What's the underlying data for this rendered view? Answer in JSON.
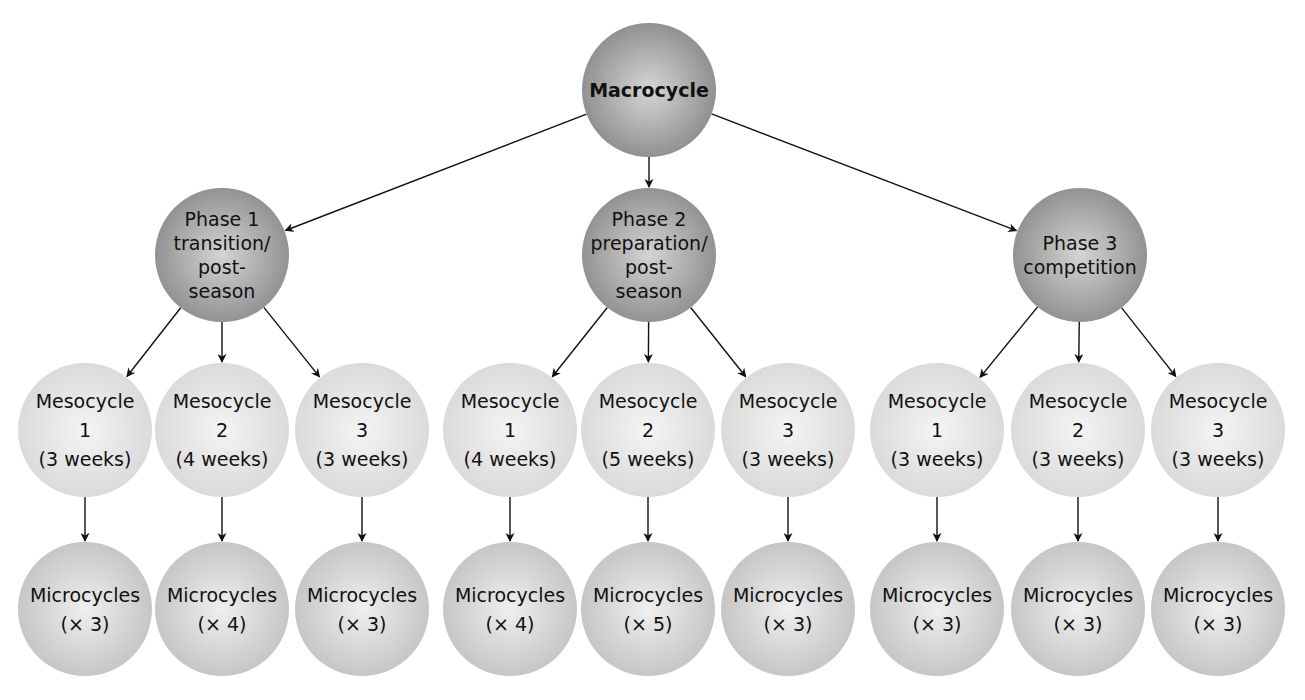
{
  "diagram": {
    "type": "hierarchy",
    "colors": {
      "macro_fill_center": "#d6d6d6",
      "macro_fill_edge": "#8a8a8a",
      "phase_fill_center": "#d4d4d4",
      "phase_fill_edge": "#8c8c8c",
      "meso_fill_center": "#f4f4f4",
      "meso_fill_edge": "#d8d8d8",
      "micro_fill_center": "#efefef",
      "micro_fill_edge": "#c2c2c2",
      "edge": "#111111"
    },
    "macrocycle": {
      "label": "Macrocycle",
      "cx": 649,
      "cy": 90,
      "r": 67
    },
    "phases": [
      {
        "lines": [
          "Phase 1",
          "transition/",
          "post-",
          "season"
        ],
        "cx": 222,
        "cy": 255,
        "r": 67,
        "mesocycles": [
          {
            "lines": [
              "Mesocycle",
              "1",
              "(3 weeks)"
            ],
            "cx": 85,
            "weeks": 3,
            "micro": {
              "lines": [
                "Microcycles",
                "(× 3)"
              ],
              "count": 3
            }
          },
          {
            "lines": [
              "Mesocycle",
              "2",
              "(4 weeks)"
            ],
            "cx": 222,
            "weeks": 4,
            "micro": {
              "lines": [
                "Microcycles",
                "(× 4)"
              ],
              "count": 4
            }
          },
          {
            "lines": [
              "Mesocycle",
              "3",
              "(3 weeks)"
            ],
            "cx": 362,
            "weeks": 3,
            "micro": {
              "lines": [
                "Microcycles",
                "(× 3)"
              ],
              "count": 3
            }
          }
        ]
      },
      {
        "lines": [
          "Phase 2",
          "preparation/",
          "post-",
          "season"
        ],
        "cx": 649,
        "cy": 255,
        "r": 67,
        "mesocycles": [
          {
            "lines": [
              "Mesocycle",
              "1",
              "(4 weeks)"
            ],
            "cx": 510,
            "weeks": 4,
            "micro": {
              "lines": [
                "Microcycles",
                "(× 4)"
              ],
              "count": 4
            }
          },
          {
            "lines": [
              "Mesocycle",
              "2",
              "(5 weeks)"
            ],
            "cx": 648,
            "weeks": 5,
            "micro": {
              "lines": [
                "Microcycles",
                "(× 5)"
              ],
              "count": 5
            }
          },
          {
            "lines": [
              "Mesocycle",
              "3",
              "(3 weeks)"
            ],
            "cx": 788,
            "weeks": 3,
            "micro": {
              "lines": [
                "Microcycles",
                "(× 3)"
              ],
              "count": 3
            }
          }
        ]
      },
      {
        "lines": [
          "Phase 3",
          "competition"
        ],
        "cx": 1080,
        "cy": 255,
        "r": 67,
        "mesocycles": [
          {
            "lines": [
              "Mesocycle",
              "1",
              "(3 weeks)"
            ],
            "cx": 937,
            "weeks": 3,
            "micro": {
              "lines": [
                "Microcycles",
                "(× 3)"
              ],
              "count": 3
            }
          },
          {
            "lines": [
              "Mesocycle",
              "2",
              "(3 weeks)"
            ],
            "cx": 1078,
            "weeks": 3,
            "micro": {
              "lines": [
                "Microcycles",
                "(× 3)"
              ],
              "count": 3
            }
          },
          {
            "lines": [
              "Mesocycle",
              "3",
              "(3 weeks)"
            ],
            "cx": 1218,
            "weeks": 3,
            "micro": {
              "lines": [
                "Microcycles",
                "(× 3)"
              ],
              "count": 3
            }
          }
        ]
      }
    ],
    "levels": {
      "meso_cy": 430,
      "meso_r": 67,
      "micro_cy": 609,
      "micro_r": 67
    }
  }
}
